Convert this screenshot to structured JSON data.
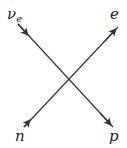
{
  "diagram": {
    "type": "particle interaction (Feynman-style) diagram",
    "particles": {
      "top_left": {
        "symbol": "ν",
        "subscript": "e",
        "role": "incoming"
      },
      "bottom_left": {
        "symbol": "n",
        "role": "incoming"
      },
      "top_right": {
        "symbol": "e",
        "role": "outgoing"
      },
      "bottom_right": {
        "symbol": "p",
        "role": "outgoing"
      }
    },
    "line_color": "#333333"
  }
}
